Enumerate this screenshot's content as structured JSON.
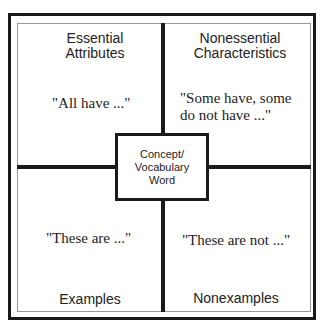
{
  "diagram": {
    "type": "Frayer model",
    "center": {
      "lines": [
        "Concept/",
        "Vocabulary",
        "Word"
      ]
    },
    "quadrants": {
      "top_left": {
        "heading_lines": [
          "Essential",
          "Attributes"
        ],
        "prompt": "\"All have ...\""
      },
      "top_right": {
        "heading_lines": [
          "Nonessential",
          "Characteristics"
        ],
        "prompt_lines": [
          "\"Some have, some",
          "do not have ...\""
        ]
      },
      "bottom_left": {
        "heading": "Examples",
        "prompt": "\"These are ...\""
      },
      "bottom_right": {
        "heading": "Nonexamples",
        "prompt": "\"These are not ...\""
      }
    },
    "colors": {
      "line": "#1a1a1a",
      "inner_border": "#9a9a9a",
      "text": "#222222",
      "background": "#ffffff"
    }
  }
}
